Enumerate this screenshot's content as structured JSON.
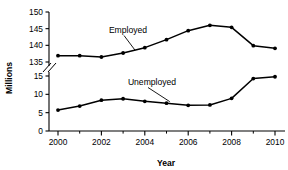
{
  "chart_data": {
    "type": "line",
    "title": "",
    "subtitle": "",
    "xlabel": "Year",
    "ylabel": "Millions",
    "x": [
      2000,
      2001,
      2002,
      2003,
      2004,
      2005,
      2006,
      2007,
      2008,
      2009,
      2010
    ],
    "xtick_labels": [
      "2000",
      "2002",
      "2004",
      "2006",
      "2008",
      "2010"
    ],
    "xtick_values": [
      2000,
      2002,
      2004,
      2006,
      2008,
      2010
    ],
    "xminor_values": [
      2001,
      2003,
      2005,
      2007,
      2009
    ],
    "xlim": [
      2000,
      2010
    ],
    "broken_axis": true,
    "axis_break_note": "y-axis broken between 135 and 15",
    "ytick_labels_upper": [
      "150",
      "145",
      "140",
      "135"
    ],
    "ytick_values_upper": [
      150,
      145,
      140,
      135
    ],
    "ytick_labels_lower": [
      "15",
      "10",
      "5",
      "0"
    ],
    "ytick_values_lower": [
      15,
      10,
      5,
      0
    ],
    "ylim_upper": [
      135,
      150
    ],
    "ylim_lower": [
      0,
      15
    ],
    "grid": false,
    "legend_position": "inline-annotation",
    "series": [
      {
        "name": "Employed",
        "label": "Employed",
        "segment": "upper",
        "values": [
          136.9,
          136.9,
          136.5,
          137.7,
          139.3,
          141.7,
          144.4,
          146.0,
          145.4,
          139.9,
          139.1
        ]
      },
      {
        "name": "Unemployed",
        "label": "Unemployed",
        "segment": "lower",
        "values": [
          5.7,
          6.8,
          8.4,
          8.8,
          8.1,
          7.6,
          7.0,
          7.1,
          8.9,
          14.3,
          14.8
        ]
      }
    ],
    "annotations": [
      {
        "text": "Employed",
        "anchor_year": 2003.55,
        "anchor_value": 138.1
      },
      {
        "text": "Unemployed",
        "anchor_year": 2005.15,
        "anchor_value": 7.6
      }
    ],
    "colors": {
      "line": "#000000",
      "marker": "#000000",
      "axis": "#000000",
      "background": "#ffffff"
    }
  }
}
